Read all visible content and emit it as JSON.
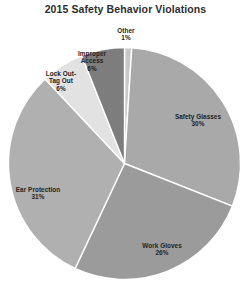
{
  "chart_data": {
    "type": "pie",
    "title": "2015 Safety Behavior Violations",
    "xlabel": "",
    "ylabel": "",
    "legend": "none",
    "grid": false,
    "labels_inside": true,
    "start_angle_deg": 0,
    "direction": "clockwise",
    "categories": [
      "Other",
      "Safety Glasses",
      "Work Gloves",
      "Ear Protection",
      "Lock Out-Tag Out",
      "Improper Access"
    ],
    "values": [
      1,
      30,
      26,
      31,
      6,
      6
    ],
    "value_labels": [
      "1%",
      "30%",
      "26%",
      "31%",
      "6%",
      "6%"
    ],
    "unit": "percent",
    "total": 100,
    "colors": [
      "#c8c8c8",
      "#a9a9a9",
      "#9b9b9b",
      "#b0b0b0",
      "#e2e2e2",
      "#7d7d7d"
    ],
    "slices": [
      {
        "name": "Other",
        "value": 1,
        "label": "Other",
        "pct_text": "1%",
        "color": "#c8c8c8"
      },
      {
        "name": "Safety Glasses",
        "value": 30,
        "label": "Safety Glasses",
        "pct_text": "30%",
        "color": "#a9a9a9"
      },
      {
        "name": "Work Gloves",
        "value": 26,
        "label": "Work Gloves",
        "pct_text": "26%",
        "color": "#9b9b9b"
      },
      {
        "name": "Ear Protection",
        "value": 31,
        "label": "Ear Protection",
        "pct_text": "31%",
        "color": "#b0b0b0"
      },
      {
        "name": "Lock Out-Tag Out",
        "value": 6,
        "label": "Lock Out-\nTag Out",
        "pct_text": "6%",
        "color": "#e2e2e2"
      },
      {
        "name": "Improper Access",
        "value": 6,
        "label": "Improper\nAccess",
        "pct_text": "6%",
        "color": "#7d7d7d"
      }
    ]
  },
  "chart": {
    "title": "2015 Safety Behavior Violations",
    "slice_separator_color": "#ffffff",
    "background": "#ffffff",
    "labels": {
      "other_name": "Other",
      "other_pct": "1%",
      "improper_name": "Improper\nAccess",
      "improper_pct": "6%",
      "lockout_name": "Lock Out-\nTag Out",
      "lockout_pct": "6%",
      "ear_name": "Ear Protection",
      "ear_pct": "31%",
      "gloves_name": "Work Gloves",
      "gloves_pct": "26%",
      "glasses_name": "Safety Glasses",
      "glasses_pct": "30%"
    }
  },
  "watermark": {
    "text": ""
  }
}
